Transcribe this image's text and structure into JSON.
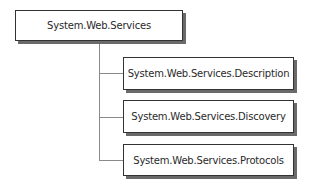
{
  "diagram": {
    "root": {
      "label": "System.Web.Services"
    },
    "children": [
      {
        "label": "System.Web.Services.Description"
      },
      {
        "label": "System.Web.Services.Discovery"
      },
      {
        "label": "System.Web.Services.Protocols"
      }
    ],
    "colors": {
      "border": "#333333",
      "shadow": "#6a6a6a",
      "connector": "#8a8a8a",
      "background": "#ffffff"
    }
  }
}
